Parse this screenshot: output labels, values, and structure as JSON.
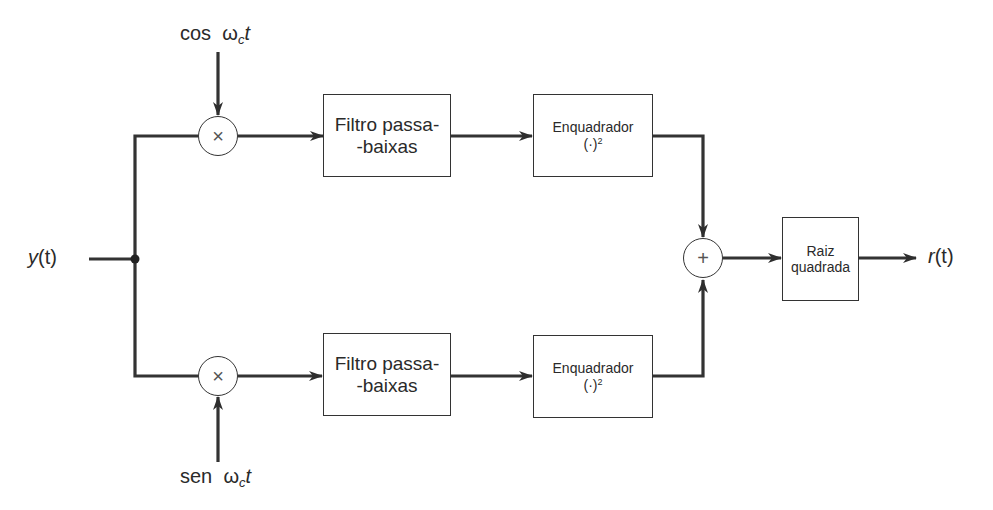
{
  "diagram": {
    "type": "block-diagram",
    "input": {
      "label_fn": "y",
      "label_arg": "(t)"
    },
    "output": {
      "label_fn": "r",
      "label_arg": "(t)"
    },
    "carriers": {
      "top": {
        "fn": "cos",
        "omega": "ω",
        "sub": "c",
        "var": "t"
      },
      "bottom": {
        "fn": "sen",
        "omega": "ω",
        "sub": "c",
        "var": "t"
      }
    },
    "multipliers": {
      "symbol": "×"
    },
    "adder": {
      "symbol": "+"
    },
    "blocks": {
      "filter_top": {
        "line1": "Filtro passa-",
        "line2": "-baixas"
      },
      "filter_bottom": {
        "line1": "Filtro passa-",
        "line2": "-baixas"
      },
      "squarer_top": {
        "line1": "Enquadrador",
        "line2_base": "(·)",
        "line2_exp": "2"
      },
      "squarer_bottom": {
        "line1": "Enquadrador",
        "line2_base": "(·)",
        "line2_exp": "2"
      },
      "sqrt": {
        "line1": "Raiz",
        "line2": "quadrada"
      }
    },
    "connections": [
      {
        "from": "y(t)",
        "to": "junction"
      },
      {
        "from": "junction",
        "to": "multiplier_top"
      },
      {
        "from": "junction",
        "to": "multiplier_bottom"
      },
      {
        "from": "cos ωc t",
        "to": "multiplier_top"
      },
      {
        "from": "sen ωc t",
        "to": "multiplier_bottom"
      },
      {
        "from": "multiplier_top",
        "to": "filter_top"
      },
      {
        "from": "multiplier_bottom",
        "to": "filter_bottom"
      },
      {
        "from": "filter_top",
        "to": "squarer_top"
      },
      {
        "from": "filter_bottom",
        "to": "squarer_bottom"
      },
      {
        "from": "squarer_top",
        "to": "adder"
      },
      {
        "from": "squarer_bottom",
        "to": "adder"
      },
      {
        "from": "adder",
        "to": "sqrt"
      },
      {
        "from": "sqrt",
        "to": "r(t)"
      }
    ],
    "colors": {
      "stroke": "#333333",
      "background": "#ffffff"
    }
  }
}
